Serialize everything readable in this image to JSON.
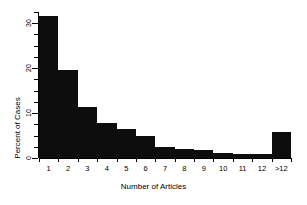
{
  "chart_data": {
    "type": "bar",
    "title": "",
    "xlabel": "Number of Articles",
    "ylabel": "Percent of Cases",
    "categories": [
      "1",
      "2",
      "3",
      "4",
      "5",
      "6",
      "7",
      "8",
      "9",
      "10",
      "11",
      "12",
      ">12"
    ],
    "values": [
      31.5,
      19.5,
      11.3,
      7.8,
      6.4,
      5.0,
      2.5,
      1.9,
      1.8,
      1.2,
      1.0,
      1.0,
      5.8
    ],
    "ylim": [
      0,
      32.5
    ],
    "yticks": [
      0,
      10,
      20,
      30
    ],
    "ytick_labels": [
      "0",
      "10",
      "20",
      "30"
    ],
    "yminor_ticks": [
      2.5,
      5,
      7.5,
      12.5,
      15,
      17.5,
      22.5,
      25,
      27.5,
      32.5
    ],
    "grid": false,
    "legend": null,
    "bar_color": "#0d0d0d",
    "background_color": "#ffffff",
    "axis_color": "#000000"
  },
  "figure": {
    "xlabel": "Number of Articles",
    "ylabel": "Percent of Cases"
  }
}
